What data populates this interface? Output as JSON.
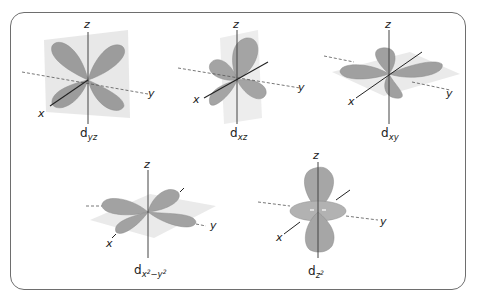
{
  "figure": {
    "colors": {
      "frame": "#6e6e6e",
      "lobe": "#9c9c9c",
      "lobe_light": "#b4b4b4",
      "plane": "#e8e8e8",
      "axis": "#333333",
      "dashed_axis": "#555555"
    },
    "axes": {
      "x": "x",
      "y": "y",
      "z": "z"
    },
    "orbitals": [
      {
        "id": "dyz",
        "base": "d",
        "subscript": "yz",
        "superscript_parts": []
      },
      {
        "id": "dxz",
        "base": "d",
        "subscript": "xz",
        "superscript_parts": []
      },
      {
        "id": "dxy",
        "base": "d",
        "subscript": "xy",
        "superscript_parts": []
      },
      {
        "id": "dx2y2",
        "base": "d",
        "subscript_parts": [
          "x",
          "2",
          "−y",
          "2"
        ]
      },
      {
        "id": "dz2",
        "base": "d",
        "subscript_parts": [
          "z",
          "2"
        ]
      }
    ]
  }
}
